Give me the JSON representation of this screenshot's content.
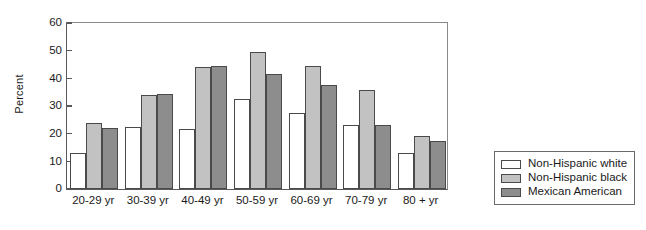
{
  "chart_data": {
    "type": "bar",
    "title": "",
    "xlabel": "",
    "ylabel": "Percent",
    "ylim": [
      0,
      60
    ],
    "yticks": [
      0,
      10,
      20,
      30,
      40,
      50,
      60
    ],
    "ytick_labels": [
      "0",
      "10",
      "20",
      "30",
      "40",
      "50",
      "60"
    ],
    "grid": false,
    "legend_position": "right-outside",
    "categories": [
      "20-29 yr",
      "30-39 yr",
      "40-49 yr",
      "50-59 yr",
      "60-69 yr",
      "70-79 yr",
      "80 + yr"
    ],
    "series": [
      {
        "name": "Non-Hispanic white",
        "color": "#ffffff",
        "values": [
          13,
          22,
          21.5,
          32,
          27,
          23,
          13
        ]
      },
      {
        "name": "Non-Hispanic black",
        "color": "#c2c2c2",
        "values": [
          23.5,
          33.5,
          43.5,
          49,
          44,
          35.5,
          19
        ]
      },
      {
        "name": "Mexican American",
        "color": "#8d8d8d",
        "values": [
          21.8,
          34,
          44,
          41,
          37,
          22.8,
          17
        ]
      }
    ]
  },
  "legend": {
    "items": [
      {
        "label": "Non-Hispanic white",
        "swatch": "legend-swatch-white"
      },
      {
        "label": "Non-Hispanic black",
        "swatch": "legend-swatch-light-gray"
      },
      {
        "label": "Mexican American",
        "swatch": "legend-swatch-dark-gray"
      }
    ]
  }
}
